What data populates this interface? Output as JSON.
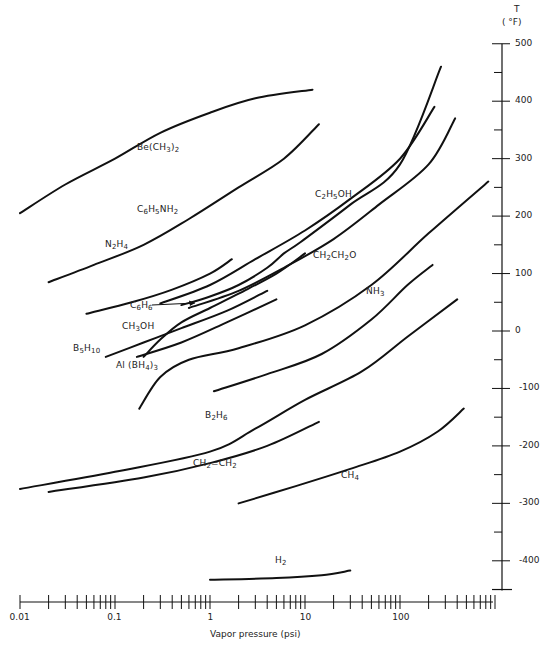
{
  "chart_data": {
    "type": "line",
    "title": "",
    "xlabel": "Vapor pressure (psi)",
    "ylabel": "T (°F)",
    "xscale": "log",
    "xlim": [
      0.01,
      1000
    ],
    "ylim": [
      -450,
      500
    ],
    "grid": false,
    "legend": "inline labels on curves",
    "x_ticks": [
      "0.01",
      "0.1",
      "1",
      "10",
      "100"
    ],
    "y_ticks": [
      "500",
      "400",
      "300",
      "200",
      "100",
      "0",
      "-100",
      "-200",
      "-300",
      "-400"
    ],
    "series": [
      {
        "name": "Be(CH3)2",
        "label": "Be(CH<sub>3</sub>)<sub>2</sub>",
        "label_pos": [
          137,
          150
        ],
        "points": [
          [
            0.01,
            205
          ],
          [
            0.03,
            255
          ],
          [
            0.1,
            300
          ],
          [
            0.3,
            345
          ],
          [
            1,
            380
          ],
          [
            3,
            405
          ],
          [
            12,
            420
          ]
        ]
      },
      {
        "name": "C6H5NH2",
        "label": "C<sub>6</sub>H<sub>5</sub>NH<sub>2</sub>",
        "label_pos": [
          137,
          212
        ],
        "points": [
          [
            0.02,
            85
          ],
          [
            0.06,
            115
          ],
          [
            0.2,
            150
          ],
          [
            0.6,
            195
          ],
          [
            2,
            250
          ],
          [
            6,
            300
          ],
          [
            14,
            360
          ]
        ]
      },
      {
        "name": "N2H4",
        "label": "N<sub>2</sub>H<sub>4</sub>",
        "label_pos": [
          105,
          247
        ],
        "points": [
          [
            0.05,
            30
          ],
          [
            0.15,
            50
          ],
          [
            0.4,
            72
          ],
          [
            1,
            100
          ],
          [
            1.7,
            125
          ]
        ]
      },
      {
        "name": "C2H5OH",
        "label": "C<sub>2</sub>H<sub>5</sub>OH",
        "label_pos": [
          315,
          197
        ],
        "points": [
          [
            0.3,
            48
          ],
          [
            1,
            80
          ],
          [
            3,
            125
          ],
          [
            10,
            175
          ],
          [
            30,
            230
          ],
          [
            100,
            300
          ],
          [
            230,
            390
          ]
        ]
      },
      {
        "name": "C6H6",
        "label": "C<sub>6</sub>H<sub>6</sub>",
        "label_pos": [
          130,
          308
        ],
        "arrow_to": [
          195,
          303
        ],
        "points": [
          [
            0.5,
            45
          ],
          [
            1,
            60
          ],
          [
            2,
            80
          ],
          [
            4,
            110
          ],
          [
            6,
            135
          ],
          [
            9,
            155
          ],
          [
            30,
            220
          ],
          [
            100,
            290
          ],
          [
            270,
            460
          ]
        ]
      },
      {
        "name": "CH2CH2O",
        "label": "CH<sub>2</sub>CH<sub>2</sub>O",
        "label_pos": [
          313,
          258
        ],
        "points": [
          [
            0.6,
            40
          ],
          [
            2,
            70
          ],
          [
            6,
            110
          ],
          [
            20,
            160
          ],
          [
            60,
            220
          ],
          [
            200,
            290
          ],
          [
            380,
            370
          ]
        ]
      },
      {
        "name": "CH3OH",
        "label": "CH<sub>3</sub>OH",
        "label_pos": [
          122,
          329
        ],
        "points": [
          [
            0.2,
            -45
          ],
          [
            0.3,
            -15
          ],
          [
            0.5,
            15
          ],
          [
            1,
            40
          ],
          [
            2,
            65
          ],
          [
            5,
            100
          ],
          [
            10,
            135
          ]
        ]
      },
      {
        "name": "B5H10",
        "label": "B<sub>5</sub>H<sub>10</sub>",
        "label_pos": [
          73,
          351
        ],
        "points": [
          [
            0.08,
            -45
          ],
          [
            0.2,
            -20
          ],
          [
            0.5,
            5
          ],
          [
            1.5,
            35
          ],
          [
            4,
            70
          ]
        ]
      },
      {
        "name": "Al(BH4)3",
        "label": "Al (BH<sub>4</sub>)<sub>3</sub>",
        "label_pos": [
          116,
          368
        ],
        "points": [
          [
            0.17,
            -45
          ],
          [
            0.5,
            -20
          ],
          [
            1.5,
            15
          ],
          [
            5,
            55
          ]
        ]
      },
      {
        "name": "NH3",
        "label": "NH<sub>3</sub>",
        "label_pos": [
          366,
          294
        ],
        "points": [
          [
            0.18,
            -135
          ],
          [
            0.3,
            -80
          ],
          [
            0.6,
            -50
          ],
          [
            2,
            -30
          ],
          [
            10,
            10
          ],
          [
            50,
            80
          ],
          [
            200,
            170
          ],
          [
            850,
            260
          ]
        ]
      },
      {
        "name": "NH3-lower",
        "label": "",
        "points": [
          [
            1.1,
            -105
          ],
          [
            4,
            -75
          ],
          [
            15,
            -40
          ],
          [
            50,
            20
          ],
          [
            120,
            80
          ],
          [
            220,
            115
          ]
        ]
      },
      {
        "name": "B2H6",
        "label": "B<sub>2</sub>H<sub>6</sub>",
        "label_pos": [
          205,
          418
        ],
        "points": [
          [
            0.01,
            -275
          ],
          [
            0.1,
            -245
          ],
          [
            1,
            -210
          ],
          [
            3,
            -170
          ],
          [
            10,
            -120
          ],
          [
            40,
            -70
          ],
          [
            120,
            -10
          ],
          [
            400,
            55
          ]
        ]
      },
      {
        "name": "CH2=CH2",
        "label": "CH<sub>2</sub>=CH<sub>2</sub>",
        "label_pos": [
          193,
          466
        ],
        "points": [
          [
            0.02,
            -280
          ],
          [
            0.2,
            -255
          ],
          [
            1,
            -230
          ],
          [
            4,
            -200
          ],
          [
            14,
            -158
          ]
        ]
      },
      {
        "name": "CH4",
        "label": "CH<sub>4</sub>",
        "label_pos": [
          341,
          478
        ],
        "points": [
          [
            2,
            -300
          ],
          [
            8,
            -270
          ],
          [
            30,
            -240
          ],
          [
            100,
            -210
          ],
          [
            250,
            -175
          ],
          [
            470,
            -135
          ]
        ]
      },
      {
        "name": "H2",
        "label": "H<sub>2</sub>",
        "label_pos": [
          275,
          563
        ],
        "points": [
          [
            1,
            -433
          ],
          [
            5,
            -430
          ],
          [
            15,
            -425
          ],
          [
            30,
            -417
          ]
        ]
      }
    ]
  },
  "axes": {
    "y_title_line1": "T",
    "y_title_line2": "( °F)",
    "x_title": "Vapor pressure (psi)"
  }
}
